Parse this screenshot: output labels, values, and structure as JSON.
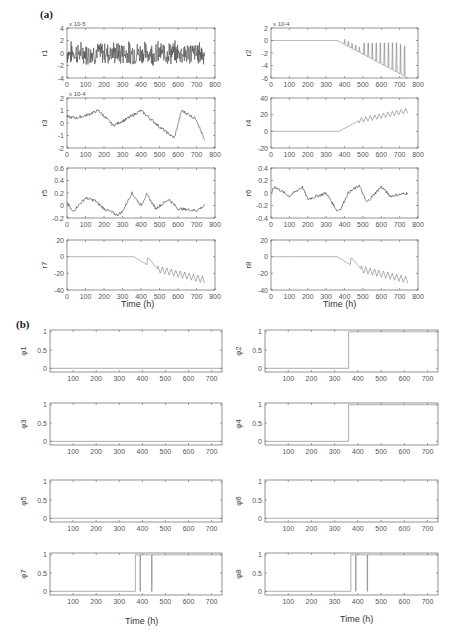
{
  "figure": {
    "panel_a_label": "(a)",
    "panel_b_label": "(b)",
    "xlabel": "Time (h)"
  },
  "chart_data": [
    {
      "type": "line",
      "panel": "(a)",
      "ylabel": "r1",
      "multiplier": "x 10^-5",
      "xlim": [
        0,
        800
      ],
      "ylim": [
        -4,
        4
      ],
      "xticks": [
        0,
        100,
        200,
        300,
        400,
        500,
        600,
        700,
        800
      ],
      "yticks": [
        -4,
        -2,
        0,
        2,
        4
      ],
      "description": "noise around 0, amplitude ~±2, t=0..745",
      "x": [
        0,
        100,
        200,
        300,
        400,
        500,
        600,
        700,
        745
      ],
      "y": [
        0,
        0.2,
        -0.1,
        0.3,
        0.1,
        0,
        -0.2,
        0.1,
        0
      ]
    },
    {
      "type": "line",
      "panel": "(a)",
      "ylabel": "r2",
      "multiplier": "x 10^-4",
      "xlim": [
        0,
        800
      ],
      "ylim": [
        -6,
        2
      ],
      "xticks": [
        0,
        100,
        200,
        300,
        400,
        500,
        600,
        700,
        800
      ],
      "yticks": [
        -6,
        -4,
        -2,
        0,
        2
      ],
      "description": "0 until ~360, then linear decline to ~-6 at 745 with oscillating spikes back to ~-0.5 from ~490",
      "x": [
        0,
        360,
        450,
        500,
        600,
        700,
        745
      ],
      "y": [
        0,
        0,
        -1.8,
        -2.6,
        -4,
        -5.4,
        -6
      ]
    },
    {
      "type": "line",
      "panel": "(a)",
      "ylabel": "r3",
      "multiplier": "x 10^-4",
      "xlim": [
        0,
        800
      ],
      "ylim": [
        -2,
        2
      ],
      "xticks": [
        0,
        100,
        200,
        300,
        400,
        500,
        600,
        700,
        800
      ],
      "yticks": [
        -2,
        -1,
        0,
        1,
        2
      ],
      "x": [
        0,
        50,
        100,
        170,
        250,
        320,
        400,
        500,
        580,
        620,
        700,
        745
      ],
      "y": [
        0.5,
        0.4,
        0.6,
        1.0,
        -0.2,
        0.3,
        1.0,
        -0.3,
        -1.2,
        1.0,
        0.3,
        -1.5
      ]
    },
    {
      "type": "line",
      "panel": "(a)",
      "ylabel": "r4",
      "xlim": [
        0,
        800
      ],
      "ylim": [
        -20,
        40
      ],
      "xticks": [
        0,
        100,
        200,
        300,
        400,
        500,
        600,
        700,
        800
      ],
      "yticks": [
        -20,
        0,
        20,
        40
      ],
      "x": [
        0,
        370,
        480,
        500,
        600,
        700,
        745
      ],
      "y": [
        0,
        0,
        13,
        15,
        18,
        25,
        28
      ]
    },
    {
      "type": "line",
      "panel": "(a)",
      "ylabel": "r5",
      "xlim": [
        0,
        800
      ],
      "ylim": [
        -0.2,
        0.6
      ],
      "xticks": [
        0,
        100,
        200,
        300,
        400,
        500,
        600,
        700,
        800
      ],
      "yticks": [
        -0.2,
        0,
        0.2,
        0.4,
        0.6
      ],
      "x": [
        0,
        30,
        100,
        150,
        200,
        270,
        300,
        350,
        400,
        430,
        480,
        550,
        600,
        700,
        745
      ],
      "y": [
        0.05,
        -0.1,
        0.12,
        0.08,
        -0.05,
        -0.15,
        -0.1,
        0.2,
        0.0,
        0.18,
        -0.05,
        0.1,
        -0.05,
        -0.08,
        0.0
      ]
    },
    {
      "type": "line",
      "panel": "(a)",
      "ylabel": "r6",
      "xlim": [
        0,
        800
      ],
      "ylim": [
        -0.4,
        0.4
      ],
      "xticks": [
        0,
        100,
        200,
        300,
        400,
        500,
        600,
        700,
        800
      ],
      "yticks": [
        -0.4,
        -0.2,
        0,
        0.2,
        0.4
      ],
      "x": [
        0,
        20,
        100,
        170,
        200,
        300,
        360,
        380,
        420,
        480,
        520,
        600,
        650,
        745
      ],
      "y": [
        0,
        0.1,
        -0.05,
        0.1,
        -0.1,
        0.0,
        -0.28,
        -0.25,
        0.0,
        0.12,
        -0.15,
        0.1,
        -0.05,
        0.0
      ]
    },
    {
      "type": "line",
      "panel": "(a)",
      "ylabel": "r7",
      "xlim": [
        0,
        800
      ],
      "ylim": [
        -40,
        20
      ],
      "xticks": [
        0,
        100,
        200,
        300,
        400,
        500,
        600,
        700,
        800
      ],
      "yticks": [
        -40,
        -20,
        0,
        20
      ],
      "x": [
        0,
        360,
        430,
        440,
        500,
        600,
        700,
        745
      ],
      "y": [
        0,
        0,
        -10,
        -2,
        -15,
        -20,
        -26,
        -30
      ]
    },
    {
      "type": "line",
      "panel": "(a)",
      "ylabel": "r8",
      "xlim": [
        0,
        800
      ],
      "ylim": [
        -40,
        20
      ],
      "xticks": [
        0,
        100,
        200,
        300,
        400,
        500,
        600,
        700,
        800
      ],
      "yticks": [
        -40,
        -20,
        0,
        20
      ],
      "x": [
        0,
        360,
        430,
        440,
        500,
        600,
        700,
        745
      ],
      "y": [
        0,
        0,
        -10,
        -2,
        -15,
        -20,
        -26,
        -30
      ]
    },
    {
      "type": "line",
      "panel": "(b)",
      "ylabel": "φ1",
      "xlim": [
        0,
        745
      ],
      "ylim": [
        -0.1,
        1.05
      ],
      "xticks": [
        100,
        200,
        300,
        400,
        500,
        600,
        700
      ],
      "yticks": [
        0,
        0.5,
        1
      ],
      "x": [
        0,
        745
      ],
      "y": [
        0,
        0
      ]
    },
    {
      "type": "line",
      "panel": "(b)",
      "ylabel": "φ2",
      "xlim": [
        0,
        745
      ],
      "ylim": [
        -0.1,
        1.05
      ],
      "xticks": [
        100,
        200,
        300,
        400,
        500,
        600,
        700
      ],
      "yticks": [
        0,
        0.5,
        1
      ],
      "x": [
        0,
        360,
        360,
        745
      ],
      "y": [
        0,
        0,
        1,
        1
      ]
    },
    {
      "type": "line",
      "panel": "(b)",
      "ylabel": "φ3",
      "xlim": [
        0,
        745
      ],
      "ylim": [
        -0.1,
        1.05
      ],
      "xticks": [
        100,
        200,
        300,
        400,
        500,
        600,
        700
      ],
      "yticks": [
        0,
        0.5,
        1
      ],
      "x": [
        0,
        745
      ],
      "y": [
        0,
        0
      ]
    },
    {
      "type": "line",
      "panel": "(b)",
      "ylabel": "φ4",
      "xlim": [
        0,
        745
      ],
      "ylim": [
        -0.1,
        1.05
      ],
      "xticks": [
        100,
        200,
        300,
        400,
        500,
        600,
        700
      ],
      "yticks": [
        0,
        0.5,
        1
      ],
      "x": [
        0,
        360,
        360,
        745
      ],
      "y": [
        0,
        0,
        1,
        1
      ]
    },
    {
      "type": "line",
      "panel": "(b)",
      "ylabel": "φ5",
      "xlim": [
        0,
        745
      ],
      "ylim": [
        -0.1,
        1.05
      ],
      "xticks": [
        100,
        200,
        300,
        400,
        500,
        600,
        700
      ],
      "yticks": [
        0,
        0.5,
        1
      ],
      "x": [
        0,
        745
      ],
      "y": [
        0,
        0
      ]
    },
    {
      "type": "line",
      "panel": "(b)",
      "ylabel": "φ6",
      "xlim": [
        0,
        745
      ],
      "ylim": [
        -0.1,
        1.05
      ],
      "xticks": [
        100,
        200,
        300,
        400,
        500,
        600,
        700
      ],
      "yticks": [
        0,
        0.5,
        1
      ],
      "x": [
        0,
        745
      ],
      "y": [
        0,
        0
      ]
    },
    {
      "type": "line",
      "panel": "(b)",
      "ylabel": "φ7",
      "xlim": [
        0,
        745
      ],
      "ylim": [
        -0.1,
        1.05
      ],
      "xticks": [
        100,
        200,
        300,
        400,
        500,
        600,
        700
      ],
      "yticks": [
        0,
        0.5,
        1
      ],
      "x": [
        0,
        370,
        370,
        390,
        390,
        392,
        392,
        440,
        440,
        442,
        442,
        745
      ],
      "y": [
        0,
        0,
        1,
        1,
        0,
        0,
        1,
        1,
        0,
        0,
        1,
        1
      ]
    },
    {
      "type": "line",
      "panel": "(b)",
      "ylabel": "φ8",
      "xlim": [
        0,
        745
      ],
      "ylim": [
        -0.1,
        1.05
      ],
      "xticks": [
        100,
        200,
        300,
        400,
        500,
        600,
        700
      ],
      "yticks": [
        0,
        0.5,
        1
      ],
      "x": [
        0,
        370,
        370,
        390,
        390,
        392,
        392,
        440,
        440,
        442,
        442,
        745
      ],
      "y": [
        0,
        0,
        1,
        1,
        0,
        0,
        1,
        1,
        0,
        0,
        1,
        1
      ]
    }
  ]
}
